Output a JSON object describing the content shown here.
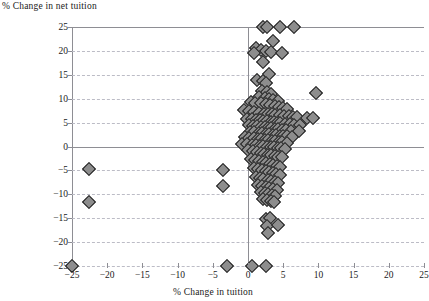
{
  "chart_data": {
    "type": "scatter",
    "title": "",
    "xlabel": "% Change in tuition",
    "ylabel": "% Change in net tuition",
    "xlim": [
      -25,
      25
    ],
    "ylim": [
      -25,
      25
    ],
    "xticks": [
      -25,
      -20,
      -15,
      -10,
      -5,
      0,
      5,
      10,
      15,
      20,
      25
    ],
    "yticks": [
      -25,
      -20,
      -15,
      -10,
      -5,
      0,
      5,
      10,
      15,
      20,
      25
    ],
    "xtick_labels": [
      "-25",
      "-20",
      "-15",
      "-10",
      "-5",
      "0",
      "5",
      "10",
      "15",
      "20",
      "25"
    ],
    "ytick_labels": [
      "25",
      "20",
      "15",
      "10",
      "5",
      "0",
      "-5",
      "-10",
      "-15",
      "-20",
      "-25"
    ],
    "grid": "horizontal-dashed",
    "legend": "none",
    "marker": "diamond",
    "marker_fill": "#8d8d8d",
    "marker_edge": "#1d1d1d",
    "points": [
      [
        -25.0,
        -25.0
      ],
      [
        -22.6,
        -4.8
      ],
      [
        -22.6,
        -11.6
      ],
      [
        -3.0,
        -25.0
      ],
      [
        0.6,
        -25.0
      ],
      [
        2.6,
        -25.0
      ],
      [
        2.1,
        25.0
      ],
      [
        2.7,
        25.0
      ],
      [
        4.6,
        25.0
      ],
      [
        6.5,
        25.0
      ],
      [
        3.6,
        22.0
      ],
      [
        1.2,
        20.6
      ],
      [
        1.9,
        20.2
      ],
      [
        2.6,
        20.0
      ],
      [
        3.2,
        19.8
      ],
      [
        0.8,
        19.6
      ],
      [
        4.8,
        19.6
      ],
      [
        2.2,
        17.6
      ],
      [
        3.0,
        15.2
      ],
      [
        1.3,
        14.0
      ],
      [
        2.1,
        13.8
      ],
      [
        2.6,
        13.2
      ],
      [
        2.0,
        11.6
      ],
      [
        2.7,
        11.4
      ],
      [
        3.3,
        11.0
      ],
      [
        9.6,
        11.2
      ],
      [
        1.5,
        10.4
      ],
      [
        2.4,
        10.2
      ],
      [
        3.0,
        10.0
      ],
      [
        3.6,
        9.8
      ],
      [
        4.2,
        9.6
      ],
      [
        0.4,
        9.4
      ],
      [
        1.0,
        9.2
      ],
      [
        1.8,
        9.0
      ],
      [
        2.5,
        8.8
      ],
      [
        3.1,
        8.6
      ],
      [
        3.8,
        8.4
      ],
      [
        4.4,
        8.2
      ],
      [
        5.0,
        8.0
      ],
      [
        5.6,
        7.8
      ],
      [
        -0.6,
        7.6
      ],
      [
        0.2,
        7.4
      ],
      [
        0.9,
        7.2
      ],
      [
        1.6,
        7.0
      ],
      [
        2.3,
        6.9
      ],
      [
        2.9,
        6.8
      ],
      [
        3.4,
        6.7
      ],
      [
        3.9,
        6.6
      ],
      [
        4.5,
        6.5
      ],
      [
        5.1,
        6.4
      ],
      [
        5.8,
        6.3
      ],
      [
        6.4,
        6.2
      ],
      [
        7.0,
        6.1
      ],
      [
        8.4,
        6.0
      ],
      [
        9.3,
        5.9
      ],
      [
        -0.2,
        5.8
      ],
      [
        0.5,
        5.7
      ],
      [
        1.1,
        5.6
      ],
      [
        1.7,
        5.5
      ],
      [
        2.2,
        5.4
      ],
      [
        2.7,
        5.3
      ],
      [
        3.2,
        5.2
      ],
      [
        3.7,
        5.1
      ],
      [
        4.1,
        5.0
      ],
      [
        4.6,
        4.9
      ],
      [
        5.2,
        4.8
      ],
      [
        5.9,
        4.7
      ],
      [
        6.6,
        4.6
      ],
      [
        7.4,
        4.5
      ],
      [
        0.1,
        4.4
      ],
      [
        0.7,
        4.3
      ],
      [
        1.3,
        4.2
      ],
      [
        1.9,
        4.1
      ],
      [
        2.4,
        4.0
      ],
      [
        2.8,
        3.9
      ],
      [
        3.3,
        3.8
      ],
      [
        3.8,
        3.7
      ],
      [
        4.3,
        3.6
      ],
      [
        4.8,
        3.5
      ],
      [
        5.4,
        3.4
      ],
      [
        6.1,
        3.3
      ],
      [
        7.2,
        3.2
      ],
      [
        0.3,
        3.1
      ],
      [
        0.9,
        3.0
      ],
      [
        1.5,
        2.9
      ],
      [
        2.0,
        2.8
      ],
      [
        2.5,
        2.7
      ],
      [
        3.0,
        2.6
      ],
      [
        3.5,
        2.5
      ],
      [
        4.0,
        2.4
      ],
      [
        4.5,
        2.3
      ],
      [
        5.0,
        2.2
      ],
      [
        5.6,
        2.1
      ],
      [
        6.3,
        2.0
      ],
      [
        -0.4,
        1.9
      ],
      [
        0.2,
        1.8
      ],
      [
        0.8,
        1.7
      ],
      [
        1.4,
        1.6
      ],
      [
        1.9,
        1.5
      ],
      [
        2.4,
        1.4
      ],
      [
        2.9,
        1.3
      ],
      [
        3.4,
        1.2
      ],
      [
        3.9,
        1.1
      ],
      [
        4.4,
        1.0
      ],
      [
        4.9,
        0.9
      ],
      [
        5.5,
        0.8
      ],
      [
        -0.8,
        0.6
      ],
      [
        -0.1,
        0.5
      ],
      [
        0.5,
        0.4
      ],
      [
        1.1,
        0.3
      ],
      [
        1.7,
        0.2
      ],
      [
        2.2,
        0.1
      ],
      [
        2.7,
        0.0
      ],
      [
        3.2,
        -0.1
      ],
      [
        3.7,
        -0.2
      ],
      [
        4.2,
        -0.3
      ],
      [
        4.7,
        -0.4
      ],
      [
        5.3,
        -0.5
      ],
      [
        0.0,
        -0.8
      ],
      [
        0.7,
        -1.0
      ],
      [
        1.3,
        -1.2
      ],
      [
        1.8,
        -1.4
      ],
      [
        2.3,
        -1.5
      ],
      [
        2.8,
        -1.7
      ],
      [
        3.3,
        -1.8
      ],
      [
        3.8,
        -2.0
      ],
      [
        4.3,
        -2.1
      ],
      [
        4.9,
        -2.3
      ],
      [
        0.4,
        -2.6
      ],
      [
        1.0,
        -2.8
      ],
      [
        1.6,
        -3.0
      ],
      [
        2.1,
        -3.2
      ],
      [
        2.6,
        -3.4
      ],
      [
        3.1,
        -3.6
      ],
      [
        3.6,
        -3.8
      ],
      [
        4.1,
        -4.0
      ],
      [
        4.6,
        -4.2
      ],
      [
        0.8,
        -4.6
      ],
      [
        1.4,
        -4.8
      ],
      [
        2.0,
        -5.0
      ],
      [
        2.5,
        -5.2
      ],
      [
        3.0,
        -5.4
      ],
      [
        3.5,
        -5.6
      ],
      [
        4.0,
        -5.8
      ],
      [
        4.5,
        -6.0
      ],
      [
        -3.5,
        -5.0
      ],
      [
        -3.5,
        -8.2
      ],
      [
        1.1,
        -6.4
      ],
      [
        1.7,
        -6.6
      ],
      [
        2.2,
        -6.8
      ],
      [
        2.8,
        -7.0
      ],
      [
        3.3,
        -7.2
      ],
      [
        3.8,
        -7.4
      ],
      [
        4.3,
        -7.6
      ],
      [
        1.4,
        -8.0
      ],
      [
        2.0,
        -8.2
      ],
      [
        2.5,
        -8.4
      ],
      [
        3.0,
        -8.6
      ],
      [
        3.6,
        -8.8
      ],
      [
        4.1,
        -9.0
      ],
      [
        1.8,
        -9.6
      ],
      [
        2.4,
        -9.8
      ],
      [
        2.9,
        -10.0
      ],
      [
        3.4,
        -10.2
      ],
      [
        3.9,
        -10.4
      ],
      [
        2.1,
        -11.0
      ],
      [
        2.7,
        -11.2
      ],
      [
        3.2,
        -11.4
      ],
      [
        3.7,
        -11.6
      ],
      [
        2.6,
        -15.2
      ],
      [
        3.1,
        -15.0
      ],
      [
        2.7,
        -16.6
      ],
      [
        4.2,
        -16.4
      ],
      [
        2.9,
        -18.2
      ]
    ]
  }
}
